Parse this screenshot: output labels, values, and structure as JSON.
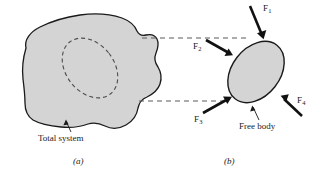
{
  "figure": {
    "background_color": "#ffffff",
    "body_fill_color": "#d4d4d4",
    "outline_color": "#1a1a1a",
    "dashed_color": "#4d4d4d"
  },
  "panel_a": {
    "caption": "(a)",
    "annotation": "Total system",
    "shape_name": "total-system-blob",
    "interior_region_name": "free-body-outline-dashed"
  },
  "panel_b": {
    "caption": "(b)",
    "annotation": "Free body",
    "shape_name": "free-body-ellipse"
  },
  "forces": [
    {
      "id": "F1",
      "label": "F",
      "subscript": "1",
      "direction": "down-right",
      "applied_at": "top"
    },
    {
      "id": "F2",
      "label": "F",
      "subscript": "2",
      "direction": "down-right",
      "applied_at": "upper-left"
    },
    {
      "id": "F3",
      "label": "F",
      "subscript": "3",
      "direction": "up-right",
      "applied_at": "lower-left"
    },
    {
      "id": "F4",
      "label": "F",
      "subscript": "4",
      "direction": "up-left",
      "applied_at": "lower-right"
    }
  ],
  "projection_lines": {
    "name": "dashed-projection-lines",
    "count": 2,
    "style": "dashed"
  }
}
